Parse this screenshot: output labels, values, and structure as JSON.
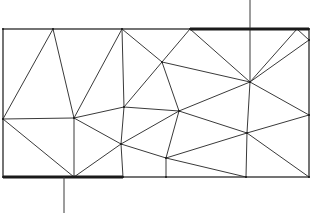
{
  "diagram": {
    "type": "triangular-mesh",
    "colors": {
      "stroke": "#3a3a3a",
      "thick": "#1a1a1a",
      "background": "#ffffff"
    },
    "rectangle": {
      "x": 3,
      "y": 29,
      "width": 306,
      "height": 148
    },
    "vertices": {
      "A": [
        3,
        29
      ],
      "B": [
        53,
        29
      ],
      "C": [
        122,
        29
      ],
      "D": [
        190,
        29
      ],
      "E": [
        250,
        29
      ],
      "F": [
        297,
        29
      ],
      "G": [
        309,
        29
      ],
      "R1": [
        309,
        40
      ],
      "R2": [
        309,
        115
      ],
      "Gb": [
        309,
        177
      ],
      "H": [
        3,
        119
      ],
      "I": [
        3,
        177
      ],
      "B1": [
        74,
        177
      ],
      "B2": [
        123,
        177
      ],
      "B3": [
        166,
        177
      ],
      "B4": [
        246,
        177
      ],
      "J": [
        74,
        118
      ],
      "K": [
        124,
        107
      ],
      "L": [
        162,
        62
      ],
      "M": [
        179,
        111
      ],
      "N": [
        121,
        144
      ],
      "O": [
        166,
        158
      ],
      "P": [
        250,
        82
      ],
      "Q": [
        247,
        133
      ]
    },
    "edges": [
      [
        "B",
        "H"
      ],
      [
        "B",
        "J"
      ],
      [
        "C",
        "J"
      ],
      [
        "C",
        "K"
      ],
      [
        "C",
        "L"
      ],
      [
        "D",
        "L"
      ],
      [
        "D",
        "P"
      ],
      [
        "L",
        "P"
      ],
      [
        "L",
        "K"
      ],
      [
        "L",
        "M"
      ],
      [
        "E",
        "P"
      ],
      [
        "F",
        "P"
      ],
      [
        "R1",
        "P"
      ],
      [
        "F",
        "R1"
      ],
      [
        "P",
        "R2"
      ],
      [
        "P",
        "M"
      ],
      [
        "P",
        "Q"
      ],
      [
        "H",
        "J"
      ],
      [
        "H",
        "B1"
      ],
      [
        "J",
        "B1"
      ],
      [
        "J",
        "K"
      ],
      [
        "J",
        "N"
      ],
      [
        "K",
        "M"
      ],
      [
        "K",
        "N"
      ],
      [
        "M",
        "N"
      ],
      [
        "M",
        "O"
      ],
      [
        "M",
        "Q"
      ],
      [
        "N",
        "B1"
      ],
      [
        "N",
        "B2"
      ],
      [
        "N",
        "O"
      ],
      [
        "O",
        "B3"
      ],
      [
        "O",
        "Q"
      ],
      [
        "O",
        "B4"
      ],
      [
        "Q",
        "R2"
      ],
      [
        "Q",
        "B4"
      ],
      [
        "Q",
        "Gb"
      ]
    ],
    "thick_boundaries": [
      {
        "name": "top-electrode",
        "from": [
          190,
          29
        ],
        "to": [
          309,
          29
        ]
      },
      {
        "name": "bottom-electrode",
        "from": [
          3,
          177
        ],
        "to": [
          123,
          177
        ]
      }
    ],
    "leads": [
      {
        "name": "top-lead",
        "from": [
          250,
          0
        ],
        "to": [
          250,
          29
        ]
      },
      {
        "name": "bottom-lead",
        "from": [
          64,
          177
        ],
        "to": [
          64,
          213
        ]
      }
    ]
  }
}
